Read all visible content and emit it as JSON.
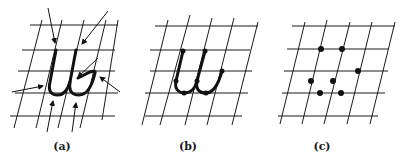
{
  "figure": {
    "panels": [
      {
        "id": "a",
        "label": "(a)",
        "description": "Cursive letter 'w' on slanted grid with arrows indicating stroke features"
      },
      {
        "id": "b",
        "label": "(b)",
        "description": "Cursive letter 'w' with key points marked as dots on the stroke"
      },
      {
        "id": "c",
        "label": "(c)",
        "description": "Extracted key points only, shown as dots on slanted grid"
      }
    ],
    "colors": {
      "ink": "#111111",
      "grid": "#1a1a1a",
      "background": "#ffffff"
    }
  }
}
